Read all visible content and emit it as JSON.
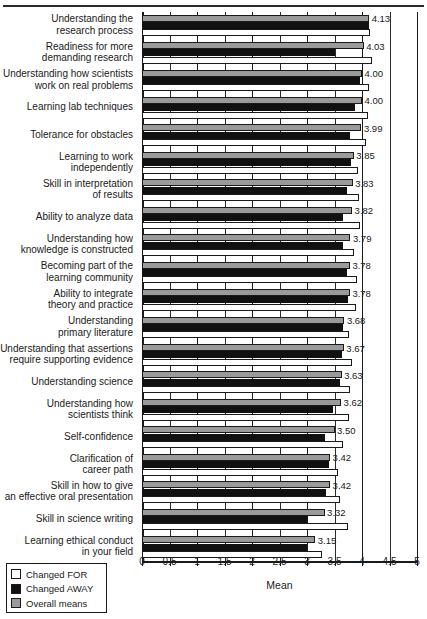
{
  "chart_data": {
    "type": "bar",
    "title": "",
    "xlabel": "Mean",
    "ylabel": "",
    "xlim": [
      0,
      5
    ],
    "grid": true,
    "orientation": "horizontal",
    "legend_position": "bottom-left",
    "xticks": [
      "0",
      "0.5",
      "1",
      "1.5",
      "2",
      "2.5",
      "3",
      "3.5",
      "4",
      "4.5",
      "5"
    ],
    "xtick_values": [
      0,
      0.5,
      1,
      1.5,
      2,
      2.5,
      3,
      3.5,
      4,
      4.5,
      5
    ],
    "categories": [
      "Understanding the\nresearch process",
      "Readiness for more\ndemanding research",
      "Understanding how scientists\nwork on real problems",
      "Learning lab techniques",
      "Tolerance for obstacles",
      "Learning to work\nindependently",
      "Skill in interpretation\nof results",
      "Ability to analyze data",
      "Understanding how\nknowledge is constructed",
      "Becoming part of the\nlearning community",
      "Ability to integrate\ntheory and practice",
      "Understanding\nprimary literature",
      "Understanding that assertions\nrequire supporting evidence",
      "Understanding science",
      "Understanding how\nscientists think",
      "Self-confidence",
      "Clarification of\ncareer path",
      "Skill in how to give\nan effective oral presentation",
      "Skill in science writing",
      "Learning ethical conduct\nin your field"
    ],
    "series": [
      {
        "name": "Overall means",
        "color": "#9a9a9a",
        "values": [
          4.13,
          4.03,
          4.0,
          4.0,
          3.99,
          3.85,
          3.83,
          3.82,
          3.79,
          3.78,
          3.78,
          3.68,
          3.67,
          3.63,
          3.62,
          3.5,
          3.42,
          3.42,
          3.32,
          3.15
        ]
      },
      {
        "name": "Changed AWAY",
        "color": "#111111",
        "values": [
          4.13,
          3.51,
          3.96,
          3.88,
          3.78,
          3.8,
          3.72,
          3.66,
          3.65,
          3.73,
          3.74,
          3.65,
          3.64,
          3.6,
          3.47,
          3.33,
          3.4,
          3.35,
          3.0,
          3.0
        ]
      },
      {
        "name": "Changed FOR",
        "color": "#ffffff",
        "values": [
          4.15,
          4.18,
          4.13,
          4.1,
          4.07,
          3.93,
          3.94,
          3.96,
          3.86,
          3.9,
          3.89,
          3.77,
          3.82,
          3.78,
          3.77,
          3.66,
          3.57,
          3.6,
          3.74,
          3.27
        ]
      }
    ],
    "value_labels": [
      "4.13",
      "4.03",
      "4.00",
      "4.00",
      "3.99",
      "3.85",
      "3.83",
      "3.82",
      "3.79",
      "3.78",
      "3.78",
      "3.68",
      "3.67",
      "3.63",
      "3.62",
      "3.50",
      "3.42",
      "3.42",
      "3.32",
      "3.15"
    ]
  },
  "legend": {
    "items": [
      {
        "label": "Changed FOR",
        "key": "forbar"
      },
      {
        "label": "Changed AWAY",
        "key": "away"
      },
      {
        "label": "Overall means",
        "key": "overall"
      }
    ]
  },
  "axis": {
    "x_title": "Mean"
  },
  "colors": {
    "overall": "#9a9a9a",
    "away": "#111111",
    "for": "#ffffff",
    "outline": "#1a1a1a"
  }
}
